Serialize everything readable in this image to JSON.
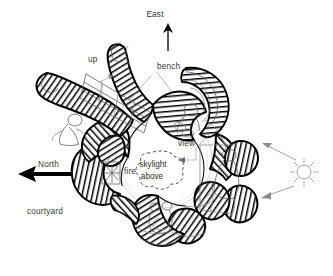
{
  "drawing": {
    "type": "architectural-floor-plan-sketch",
    "title": "",
    "background_color": "#ffffff",
    "ink_color": "#000000",
    "label_color": "#3a3a3a"
  },
  "labels": {
    "east": "East",
    "up": "up",
    "bench": "bench",
    "view": "view",
    "skylight_line1": "skylight",
    "skylight_line2": "above",
    "north": "North",
    "fire": "fire",
    "courtyard": "courtyard"
  },
  "icons": {
    "east_arrow": "arrow-up-icon",
    "north_arrow": "arrow-left-icon",
    "up_arrow": "stair-direction-arrow-icon",
    "view_arrow": "view-direction-arrow-icon",
    "sun": "sun-icon",
    "sun_arrow_upper": "sun-ray-arrow-icon",
    "sun_arrow_lower": "sun-ray-arrow-icon"
  },
  "elements": {
    "walls": "poche-hatched-thick-walls",
    "central_space": "open-round-courtyard",
    "stair": "stair-grid",
    "figures_count": 5,
    "lobes_count": 8
  }
}
